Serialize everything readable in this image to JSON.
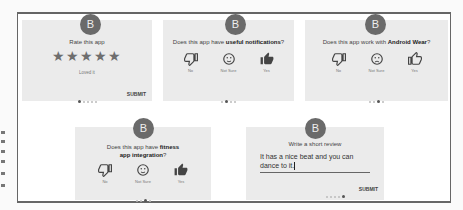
{
  "avatar_letter": "B",
  "cards": [
    {
      "question_plain": "Rate this app",
      "rating_stars": 5,
      "rating_max": 5,
      "rating_label": "Loved it",
      "page_index": 0,
      "page_count": 5,
      "submit_label": "SUBMIT"
    },
    {
      "question_prefix": "Does this app have ",
      "question_bold": "useful notifications",
      "question_suffix": "?",
      "choices": [
        "No",
        "Not Sure",
        "Yes"
      ],
      "page_index": 1,
      "page_count": 4
    },
    {
      "question_prefix": "Does this app work with ",
      "question_bold": "Android Wear",
      "question_suffix": "?",
      "choices": [
        "No",
        "Not Sure",
        "Yes"
      ],
      "page_index": 2,
      "page_count": 4
    },
    {
      "question_prefix": "Does this app have ",
      "question_bold": "fitness app integration",
      "question_suffix": "?",
      "choices": [
        "No",
        "Not Sure",
        "Yes"
      ],
      "page_index": 2,
      "page_count": 4
    },
    {
      "question_plain": "Write a short review",
      "review_text": "It has a nice beat and you can dance to it.",
      "page_index": 4,
      "page_count": 5,
      "submit_label": "SUBMIT"
    }
  ],
  "stars_glyph": "★★★★★"
}
